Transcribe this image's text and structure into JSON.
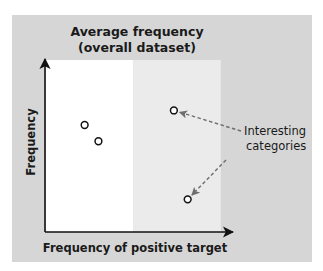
{
  "chart_data": {
    "type": "scatter",
    "title": "Average frequency (overall dataset)",
    "title_lines": [
      "Average frequency",
      "(overall dataset)"
    ],
    "xlabel": "Frequency of positive target",
    "ylabel": "Frequency",
    "xlim": [
      0,
      1
    ],
    "ylim": [
      0,
      1
    ],
    "grid": false,
    "ticks": false,
    "regions": [
      {
        "name": "below-average",
        "x_range": [
          0,
          0.475
        ],
        "color": "#ffffff"
      },
      {
        "name": "above-average",
        "x_range": [
          0.475,
          0.95
        ],
        "color": "#ebebeb"
      }
    ],
    "points": [
      {
        "x": 0.21,
        "y": 0.62,
        "interesting": false
      },
      {
        "x": 0.285,
        "y": 0.525,
        "interesting": false
      },
      {
        "x": 0.695,
        "y": 0.705,
        "interesting": true
      },
      {
        "x": 0.77,
        "y": 0.185,
        "interesting": true
      }
    ],
    "annotation": {
      "lines": [
        "Interesting",
        "categories"
      ],
      "targets": "interesting points",
      "arrow_style": "dashed"
    }
  },
  "colors": {
    "background_panel": "#d6d6d6",
    "plot_white": "#ffffff",
    "plot_light": "#ebebeb",
    "axis": "#111111",
    "marker_stroke": "#111111",
    "marker_fill": "#ffffff",
    "arrow_dashed": "#6e6e6e",
    "text": "#1a1a1a"
  }
}
